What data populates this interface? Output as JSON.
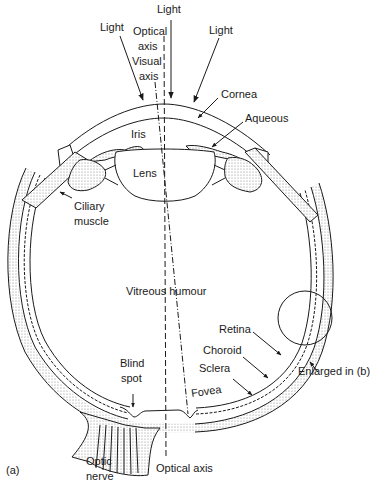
{
  "figure": {
    "panel_label": "(a)",
    "colors": {
      "ink": "#1a1a1a",
      "stipple": "#cfcfcf",
      "background": "#ffffff"
    }
  },
  "labels": {
    "light_left": "Light",
    "light_center": "Light",
    "light_right": "Light",
    "optical_axis_top_1": "Optical",
    "optical_axis_top_2": "axis",
    "visual_axis_1": "Visual",
    "visual_axis_2": "axis",
    "cornea": "Cornea",
    "aqueous": "Aqueous",
    "iris": "Iris",
    "lens": "Lens",
    "ciliary_muscle_1": "Ciliary",
    "ciliary_muscle_2": "muscle",
    "vitreous_humour": "Vitreous humour",
    "retina": "Retina",
    "choroid": "Choroid",
    "sclera": "Sclera",
    "blind_spot_1": "Blind",
    "blind_spot_2": "spot",
    "fovea": "Fovea",
    "enlarged": "Enlarged in (b)",
    "optic_nerve_1": "Optic",
    "optic_nerve_2": "nerve",
    "optical_axis_bottom": "Optical axis"
  }
}
